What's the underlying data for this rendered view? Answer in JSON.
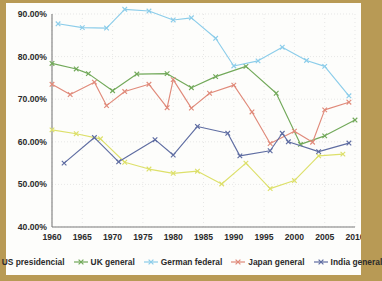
{
  "chart_data": {
    "type": "line",
    "title": "",
    "subtitle": "",
    "xlabel": "",
    "ylabel": "",
    "xlim": [
      1960,
      2010
    ],
    "ylim": [
      40,
      90
    ],
    "ytick_labels": [
      "40.00%",
      "50.00%",
      "60.00%",
      "70.00%",
      "80.00%",
      "90.00%"
    ],
    "ytick_values": [
      40,
      50,
      60,
      70,
      80,
      90
    ],
    "xtick_labels": [
      "1960",
      "1965",
      "1970",
      "1975",
      "1980",
      "1985",
      "1990",
      "1995",
      "2000",
      "2005",
      "2010"
    ],
    "xtick_values": [
      1960,
      1965,
      1970,
      1975,
      1980,
      1985,
      1990,
      1995,
      2000,
      2005,
      2010
    ],
    "grid": true,
    "legend_position": "bottom",
    "y_unit": "%",
    "series": [
      {
        "name": "US presidencial",
        "color": "#dde06a",
        "marker": "x",
        "points": [
          [
            1960,
            62.8
          ],
          [
            1964,
            61.9
          ],
          [
            1968,
            60.7
          ],
          [
            1972,
            55.2
          ],
          [
            1976,
            53.6
          ],
          [
            1980,
            52.6
          ],
          [
            1984,
            53.1
          ],
          [
            1988,
            50.1
          ],
          [
            1992,
            55.0
          ],
          [
            1996,
            49.0
          ],
          [
            2000,
            50.9
          ],
          [
            2004,
            56.7
          ],
          [
            2008,
            57.1
          ]
        ]
      },
      {
        "name": "UK general",
        "color": "#72a95a",
        "marker": "x",
        "points": [
          [
            1960,
            78.4
          ],
          [
            1964,
            77.1
          ],
          [
            1966,
            76.0
          ],
          [
            1970,
            72.0
          ],
          [
            1974,
            75.9
          ],
          [
            1979,
            76.0
          ],
          [
            1983,
            72.7
          ],
          [
            1987,
            75.3
          ],
          [
            1992,
            77.7
          ],
          [
            1997,
            71.4
          ],
          [
            2001,
            59.4
          ],
          [
            2005,
            61.4
          ],
          [
            2010,
            65.1
          ]
        ]
      },
      {
        "name": "German federal",
        "color": "#8ccdea",
        "marker": "x",
        "points": [
          [
            1961,
            87.7
          ],
          [
            1965,
            86.8
          ],
          [
            1969,
            86.7
          ],
          [
            1972,
            91.1
          ],
          [
            1976,
            90.7
          ],
          [
            1980,
            88.6
          ],
          [
            1983,
            89.1
          ],
          [
            1987,
            84.3
          ],
          [
            1990,
            77.8
          ],
          [
            1994,
            79.0
          ],
          [
            1998,
            82.2
          ],
          [
            2002,
            79.1
          ],
          [
            2005,
            77.7
          ],
          [
            2009,
            70.8
          ]
        ]
      },
      {
        "name": "Japan general",
        "color": "#e08a7a",
        "marker": "x",
        "points": [
          [
            1960,
            73.5
          ],
          [
            1963,
            71.1
          ],
          [
            1967,
            74.0
          ],
          [
            1969,
            68.5
          ],
          [
            1972,
            71.8
          ],
          [
            1976,
            73.5
          ],
          [
            1979,
            68.0
          ],
          [
            1980,
            74.6
          ],
          [
            1983,
            67.9
          ],
          [
            1986,
            71.4
          ],
          [
            1990,
            73.3
          ],
          [
            1993,
            67.0
          ],
          [
            1996,
            59.6
          ],
          [
            2000,
            62.5
          ],
          [
            2003,
            59.9
          ],
          [
            2005,
            67.5
          ],
          [
            2009,
            69.3
          ]
        ]
      },
      {
        "name": "India general",
        "color": "#5f6da2",
        "marker": "x",
        "points": [
          [
            1962,
            55.0
          ],
          [
            1967,
            61.0
          ],
          [
            1971,
            55.3
          ],
          [
            1977,
            60.5
          ],
          [
            1980,
            56.9
          ],
          [
            1984,
            63.6
          ],
          [
            1989,
            62.0
          ],
          [
            1991,
            56.7
          ],
          [
            1996,
            57.9
          ],
          [
            1998,
            62.0
          ],
          [
            1999,
            60.0
          ],
          [
            2004,
            57.7
          ],
          [
            2009,
            59.7
          ]
        ]
      }
    ]
  },
  "legend": {
    "items": [
      {
        "label": "US presidencial",
        "color": "#dde06a"
      },
      {
        "label": "UK general",
        "color": "#72a95a"
      },
      {
        "label": "German federal",
        "color": "#8ccdea"
      },
      {
        "label": "Japan general",
        "color": "#e08a7a"
      },
      {
        "label": "India general",
        "color": "#5f6da2"
      }
    ]
  },
  "theme": {
    "page_background": "#b89a55",
    "card_background": "#fdfdfb",
    "axis_color": "#7d7d7d",
    "grid_color": "#d9d9d9",
    "text_color": "#2b2b2b"
  }
}
